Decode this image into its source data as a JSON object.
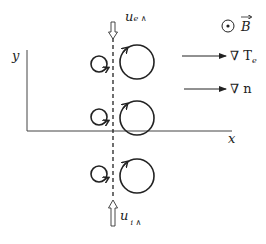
{
  "diagram": {
    "axes": {
      "x_label": "x",
      "y_label": "y"
    },
    "flows": {
      "electron": {
        "symbol": "u",
        "subscript": "e ∧",
        "direction": "down"
      },
      "ion": {
        "symbol": "u",
        "subscript": "i ∧",
        "direction": "up"
      }
    },
    "legend": {
      "magnetic_field": {
        "symbol": "B",
        "note": "out of page (⊙)"
      },
      "temperature_gradient": {
        "label": "∇ T",
        "subscript": "e"
      },
      "density_gradient": {
        "label": "∇ n"
      }
    },
    "orbits": [
      {
        "row": 1,
        "small": "left of dashed line",
        "large": "right of dashed line"
      },
      {
        "row": 2,
        "small": "left of dashed line",
        "large": "right of dashed line"
      },
      {
        "row": 3,
        "small": "left of dashed line",
        "large": "right of dashed line"
      }
    ],
    "colors": {
      "ink": "#222222",
      "background": "#ffffff"
    }
  }
}
